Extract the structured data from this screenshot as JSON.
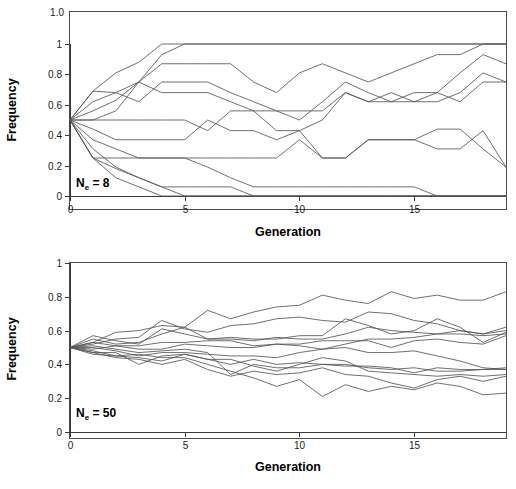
{
  "figure": {
    "title_visible": false,
    "background": "#ffffff",
    "line_color": "#555555",
    "axis_color": "#3a3a3a"
  },
  "chart_data": [
    {
      "type": "line",
      "panel": "top",
      "title": "",
      "xlabel": "Generation",
      "ylabel": "Frequency",
      "annotation": "Ne = 8",
      "annotation_base": "N",
      "annotation_sub": "e",
      "annotation_rest": " = 8",
      "xlim": [
        0,
        19
      ],
      "ylim": [
        0,
        1
      ],
      "xticks": [
        0,
        5,
        10,
        15
      ],
      "xticklabels": [
        "0",
        "5",
        "10",
        "15"
      ],
      "yticks": [
        0,
        0.2,
        0.4,
        0.6,
        0.8,
        1.0
      ],
      "yticklabels": [
        "0",
        "0.2",
        "0.4",
        "0.6",
        "0.8",
        "1"
      ],
      "extra_ytick_top_label": "1.0",
      "grid": false,
      "legend": "none",
      "x": [
        0,
        1,
        2,
        3,
        4,
        5,
        6,
        7,
        8,
        9,
        10,
        11,
        12,
        13,
        14,
        15,
        16,
        17,
        18,
        19
      ],
      "series": [
        {
          "name": "replicate-1",
          "values": [
            0.5,
            0.69,
            0.81,
            0.88,
            1.0,
            1.0,
            1.0,
            1.0,
            1.0,
            1.0,
            1.0,
            1.0,
            1.0,
            1.0,
            1.0,
            1.0,
            1.0,
            1.0,
            1.0,
            1.0
          ]
        },
        {
          "name": "replicate-2",
          "values": [
            0.5,
            0.56,
            0.63,
            0.75,
            0.87,
            0.87,
            0.87,
            0.87,
            0.75,
            0.68,
            0.81,
            0.87,
            0.81,
            0.75,
            0.81,
            0.87,
            0.93,
            0.93,
            1.0,
            1.0
          ]
        },
        {
          "name": "replicate-3",
          "values": [
            0.5,
            0.62,
            0.68,
            0.62,
            0.75,
            0.75,
            0.75,
            0.68,
            0.62,
            0.56,
            0.5,
            0.62,
            0.75,
            0.68,
            0.62,
            0.68,
            0.68,
            0.81,
            0.93,
            0.87
          ]
        },
        {
          "name": "replicate-4",
          "values": [
            0.5,
            0.69,
            0.68,
            0.75,
            0.68,
            0.68,
            0.68,
            0.62,
            0.56,
            0.43,
            0.43,
            0.5,
            0.68,
            0.62,
            0.62,
            0.62,
            0.62,
            0.68,
            0.81,
            0.75
          ]
        },
        {
          "name": "replicate-5",
          "values": [
            0.5,
            0.5,
            0.5,
            0.5,
            0.5,
            0.5,
            0.43,
            0.56,
            0.56,
            0.56,
            0.56,
            0.56,
            0.68,
            0.62,
            0.68,
            0.62,
            0.68,
            0.62,
            0.75,
            0.75
          ]
        },
        {
          "name": "replicate-6",
          "values": [
            0.5,
            0.44,
            0.37,
            0.37,
            0.37,
            0.37,
            0.5,
            0.43,
            0.43,
            0.37,
            0.43,
            0.25,
            0.25,
            0.37,
            0.37,
            0.37,
            0.31,
            0.31,
            0.43,
            0.19
          ]
        },
        {
          "name": "replicate-7",
          "values": [
            0.5,
            0.37,
            0.31,
            0.25,
            0.25,
            0.25,
            0.25,
            0.25,
            0.25,
            0.25,
            0.37,
            0.25,
            0.25,
            0.37,
            0.37,
            0.37,
            0.44,
            0.44,
            0.31,
            0.19
          ]
        },
        {
          "name": "replicate-8",
          "values": [
            0.5,
            0.25,
            0.25,
            0.25,
            0.25,
            0.25,
            0.19,
            0.12,
            0.06,
            0.06,
            0.06,
            0.06,
            0.06,
            0.06,
            0.06,
            0.06,
            0.0,
            0.0,
            0.0,
            0.0
          ]
        },
        {
          "name": "replicate-9",
          "values": [
            0.5,
            0.25,
            0.18,
            0.12,
            0.06,
            0.06,
            0.06,
            0.06,
            0.0,
            0.0,
            0.0,
            0.0,
            0.0,
            0.0,
            0.0,
            0.0,
            0.0,
            0.0,
            0.0,
            0.0
          ]
        },
        {
          "name": "replicate-10",
          "values": [
            0.5,
            0.31,
            0.19,
            0.12,
            0.06,
            0.0,
            0.0,
            0.0,
            0.0,
            0.0,
            0.0,
            0.0,
            0.0,
            0.0,
            0.0,
            0.0,
            0.0,
            0.0,
            0.0,
            0.0
          ]
        },
        {
          "name": "replicate-11",
          "values": [
            0.5,
            0.25,
            0.12,
            0.06,
            0.0,
            0.0,
            0.0,
            0.0,
            0.0,
            0.0,
            0.0,
            0.0,
            0.0,
            0.0,
            0.0,
            0.0,
            0.0,
            0.0,
            0.0,
            0.0
          ]
        },
        {
          "name": "replicate-12",
          "values": [
            0.5,
            0.5,
            0.56,
            0.75,
            0.93,
            1.0,
            1.0,
            1.0,
            1.0,
            1.0,
            1.0,
            1.0,
            1.0,
            1.0,
            1.0,
            1.0,
            1.0,
            1.0,
            1.0,
            1.0
          ]
        }
      ]
    },
    {
      "type": "line",
      "panel": "bottom",
      "title": "",
      "xlabel": "Generation",
      "ylabel": "Frequency",
      "annotation": "Ne = 50",
      "annotation_base": "N",
      "annotation_sub": "e",
      "annotation_rest": " = 50",
      "xlim": [
        0,
        19
      ],
      "ylim": [
        0,
        1
      ],
      "xticks": [
        0,
        5,
        10,
        15
      ],
      "xticklabels": [
        "0",
        "5",
        "10",
        "15"
      ],
      "yticks": [
        0,
        0.2,
        0.4,
        0.6,
        0.8,
        1.0
      ],
      "yticklabels": [
        "0",
        "0.2",
        "0.4",
        "0.6",
        "0.8",
        "1"
      ],
      "grid": false,
      "legend": "none",
      "x": [
        0,
        1,
        2,
        3,
        4,
        5,
        6,
        7,
        8,
        9,
        10,
        11,
        12,
        13,
        14,
        15,
        16,
        17,
        18,
        19
      ],
      "series": [
        {
          "name": "replicate-1",
          "values": [
            0.5,
            0.53,
            0.59,
            0.6,
            0.63,
            0.62,
            0.72,
            0.67,
            0.71,
            0.74,
            0.75,
            0.81,
            0.78,
            0.76,
            0.83,
            0.79,
            0.81,
            0.78,
            0.78,
            0.83
          ]
        },
        {
          "name": "replicate-2",
          "values": [
            0.5,
            0.52,
            0.55,
            0.56,
            0.66,
            0.61,
            0.59,
            0.63,
            0.64,
            0.67,
            0.68,
            0.66,
            0.65,
            0.71,
            0.7,
            0.66,
            0.64,
            0.6,
            0.58,
            0.62
          ]
        },
        {
          "name": "replicate-3",
          "values": [
            0.5,
            0.55,
            0.52,
            0.53,
            0.58,
            0.62,
            0.55,
            0.56,
            0.55,
            0.55,
            0.57,
            0.57,
            0.67,
            0.63,
            0.58,
            0.6,
            0.67,
            0.62,
            0.53,
            0.59
          ]
        },
        {
          "name": "replicate-4",
          "values": [
            0.5,
            0.57,
            0.54,
            0.52,
            0.61,
            0.58,
            0.55,
            0.55,
            0.54,
            0.56,
            0.55,
            0.55,
            0.58,
            0.62,
            0.6,
            0.59,
            0.58,
            0.6,
            0.58,
            0.6
          ]
        },
        {
          "name": "replicate-5",
          "values": [
            0.5,
            0.53,
            0.51,
            0.51,
            0.53,
            0.53,
            0.54,
            0.54,
            0.51,
            0.52,
            0.51,
            0.49,
            0.52,
            0.55,
            0.55,
            0.56,
            0.58,
            0.58,
            0.57,
            0.58
          ]
        },
        {
          "name": "replicate-6",
          "values": [
            0.5,
            0.49,
            0.51,
            0.49,
            0.49,
            0.52,
            0.51,
            0.5,
            0.5,
            0.52,
            0.52,
            0.54,
            0.54,
            0.54,
            0.5,
            0.54,
            0.55,
            0.53,
            0.52,
            0.57
          ]
        },
        {
          "name": "replicate-7",
          "values": [
            0.5,
            0.5,
            0.48,
            0.45,
            0.47,
            0.47,
            0.46,
            0.45,
            0.45,
            0.44,
            0.47,
            0.49,
            0.5,
            0.47,
            0.47,
            0.48,
            0.45,
            0.42,
            0.38,
            0.37
          ]
        },
        {
          "name": "replicate-8",
          "values": [
            0.5,
            0.47,
            0.47,
            0.4,
            0.45,
            0.46,
            0.43,
            0.4,
            0.43,
            0.4,
            0.41,
            0.4,
            0.4,
            0.38,
            0.37,
            0.38,
            0.36,
            0.36,
            0.37,
            0.37
          ]
        },
        {
          "name": "replicate-9",
          "values": [
            0.5,
            0.48,
            0.45,
            0.44,
            0.42,
            0.46,
            0.43,
            0.43,
            0.39,
            0.36,
            0.4,
            0.44,
            0.42,
            0.36,
            0.35,
            0.34,
            0.33,
            0.34,
            0.33,
            0.34
          ]
        },
        {
          "name": "replicate-10",
          "values": [
            0.5,
            0.47,
            0.44,
            0.43,
            0.4,
            0.43,
            0.37,
            0.33,
            0.36,
            0.34,
            0.35,
            0.38,
            0.34,
            0.33,
            0.29,
            0.26,
            0.31,
            0.33,
            0.3,
            0.33
          ]
        },
        {
          "name": "replicate-11",
          "values": [
            0.5,
            0.46,
            0.45,
            0.46,
            0.44,
            0.44,
            0.4,
            0.36,
            0.32,
            0.27,
            0.31,
            0.21,
            0.28,
            0.24,
            0.27,
            0.25,
            0.29,
            0.27,
            0.22,
            0.23
          ]
        },
        {
          "name": "replicate-12",
          "values": [
            0.5,
            0.51,
            0.49,
            0.47,
            0.48,
            0.49,
            0.47,
            0.34,
            0.4,
            0.38,
            0.38,
            0.4,
            0.39,
            0.39,
            0.38,
            0.35,
            0.38,
            0.37,
            0.37,
            0.38
          ]
        }
      ]
    }
  ]
}
